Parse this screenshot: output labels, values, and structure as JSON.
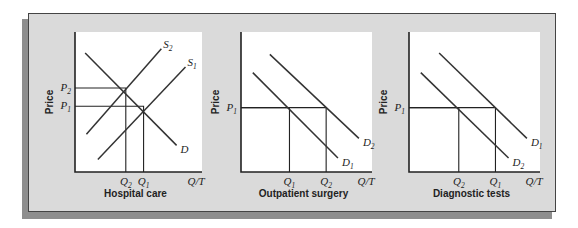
{
  "chart_data": [
    {
      "type": "line",
      "title": "Hospital care",
      "xlabel": "Q/T",
      "ylabel": "Price",
      "y_ticks": [
        {
          "main": "P",
          "sub": "2",
          "value": 0.6
        },
        {
          "main": "P",
          "sub": "1",
          "value": 0.47
        }
      ],
      "x_ticks": [
        {
          "main": "Q",
          "sub": "2",
          "value": 0.4
        },
        {
          "main": "Q",
          "sub": "1",
          "value": 0.54
        }
      ],
      "series": [
        {
          "name": "D",
          "main": "D",
          "sub": "",
          "points": [
            [
              0.08,
              0.85
            ],
            [
              0.8,
              0.19
            ]
          ]
        },
        {
          "name": "S2",
          "main": "S",
          "sub": "2",
          "points": [
            [
              0.09,
              0.27
            ],
            [
              0.68,
              0.88
            ]
          ]
        },
        {
          "name": "S1",
          "main": "S",
          "sub": "1",
          "points": [
            [
              0.18,
              0.09
            ],
            [
              0.87,
              0.75
            ]
          ]
        }
      ],
      "guides": [
        {
          "x": 0.4,
          "y": 0.6
        },
        {
          "x": 0.54,
          "y": 0.47
        }
      ]
    },
    {
      "type": "line",
      "title": "Outpatient surgery",
      "xlabel": "Q/T",
      "ylabel": "Price",
      "y_ticks": [
        {
          "main": "P",
          "sub": "1",
          "value": 0.46
        }
      ],
      "x_ticks": [
        {
          "main": "Q",
          "sub": "1",
          "value": 0.37
        },
        {
          "main": "Q",
          "sub": "2",
          "value": 0.65
        }
      ],
      "series": [
        {
          "name": "D1",
          "main": "D",
          "sub": "1",
          "points": [
            [
              0.09,
              0.71
            ],
            [
              0.74,
              0.1
            ]
          ]
        },
        {
          "name": "D2",
          "main": "D",
          "sub": "2",
          "points": [
            [
              0.22,
              0.84
            ],
            [
              0.9,
              0.24
            ]
          ]
        }
      ],
      "guides": [
        {
          "x": 0.37,
          "y": 0.46
        },
        {
          "x": 0.65,
          "y": 0.46
        }
      ]
    },
    {
      "type": "line",
      "title": "Diagnostic tests",
      "xlabel": "Q/T",
      "ylabel": "Price",
      "y_ticks": [
        {
          "main": "P",
          "sub": "1",
          "value": 0.46
        }
      ],
      "x_ticks": [
        {
          "main": "Q",
          "sub": "2",
          "value": 0.38
        },
        {
          "main": "Q",
          "sub": "1",
          "value": 0.66
        }
      ],
      "series": [
        {
          "name": "D1",
          "main": "D",
          "sub": "1",
          "points": [
            [
              0.23,
              0.85
            ],
            [
              0.9,
              0.24
            ]
          ]
        },
        {
          "name": "D2",
          "main": "D",
          "sub": "2",
          "points": [
            [
              0.09,
              0.71
            ],
            [
              0.76,
              0.1
            ]
          ]
        }
      ],
      "guides": [
        {
          "x": 0.38,
          "y": 0.46
        },
        {
          "x": 0.66,
          "y": 0.46
        }
      ]
    }
  ]
}
